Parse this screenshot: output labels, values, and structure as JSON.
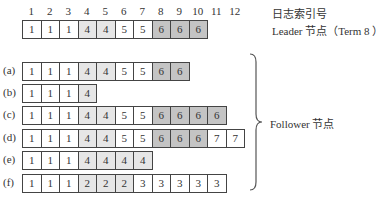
{
  "index_header_label": "日志索引号",
  "leader_label": "Leader 节点（Term 8 ）",
  "follower_label": "Follower 节点",
  "indices": [
    "1",
    "2",
    "3",
    "4",
    "5",
    "6",
    "7",
    "8",
    "9",
    "10",
    "11",
    "12"
  ],
  "colors": {
    "term1": "#ffffff",
    "term2": "#e6e6e6",
    "term3": "#ffffff",
    "term4": "#e6e6e6",
    "term5": "#ffffff",
    "term6": "#c4c4c4",
    "term7": "#ffffff",
    "border": "#444444"
  },
  "leader": {
    "entries": [
      "1",
      "1",
      "1",
      "4",
      "4",
      "5",
      "5",
      "6",
      "6",
      "6"
    ]
  },
  "followers": [
    {
      "label": "(a)",
      "entries": [
        "1",
        "1",
        "1",
        "4",
        "4",
        "5",
        "5",
        "6",
        "6"
      ]
    },
    {
      "label": "(b)",
      "entries": [
        "1",
        "1",
        "1",
        "4"
      ]
    },
    {
      "label": "(c)",
      "entries": [
        "1",
        "1",
        "1",
        "4",
        "4",
        "5",
        "5",
        "6",
        "6",
        "6",
        "6"
      ]
    },
    {
      "label": "(d)",
      "entries": [
        "1",
        "1",
        "1",
        "4",
        "4",
        "5",
        "5",
        "6",
        "6",
        "6",
        "7",
        "7"
      ]
    },
    {
      "label": "(e)",
      "entries": [
        "1",
        "1",
        "1",
        "4",
        "4",
        "4",
        "4"
      ]
    },
    {
      "label": "(f)",
      "entries": [
        "1",
        "1",
        "1",
        "2",
        "2",
        "2",
        "3",
        "3",
        "3",
        "3",
        "3"
      ]
    }
  ]
}
